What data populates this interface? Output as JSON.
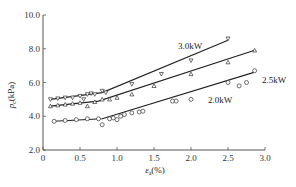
{
  "chart_data": {
    "type": "scatter",
    "title": "",
    "xlabel": "ε_a(%)",
    "ylabel": "p_c (kPa)",
    "xlim": [
      0,
      3.0
    ],
    "ylim": [
      2.0,
      10.0
    ],
    "x_ticks": [
      "0",
      "0.5",
      "1.0",
      "1.5",
      "2.0",
      "2.5",
      "3.0"
    ],
    "y_ticks": [
      "2.0",
      "4.0",
      "6.0",
      "8.0",
      "10.0"
    ],
    "grid": false,
    "legend": "inline labels",
    "series": [
      {
        "name": "3.0kW",
        "marker": "triangle-down",
        "fit_line": [
          [
            0.1,
            5.0
          ],
          [
            0.8,
            5.4
          ],
          [
            2.5,
            8.5
          ]
        ],
        "points": [
          [
            0.1,
            5.0
          ],
          [
            0.2,
            5.05
          ],
          [
            0.3,
            5.1
          ],
          [
            0.4,
            5.1
          ],
          [
            0.5,
            5.2
          ],
          [
            0.55,
            5.0
          ],
          [
            0.6,
            5.3
          ],
          [
            0.65,
            5.35
          ],
          [
            0.7,
            5.3
          ],
          [
            0.8,
            5.5
          ],
          [
            0.85,
            5.4
          ],
          [
            1.2,
            5.9
          ],
          [
            1.6,
            6.5
          ],
          [
            2.0,
            7.3
          ],
          [
            2.5,
            8.6
          ]
        ]
      },
      {
        "name": "2.5kW",
        "marker": "triangle-up",
        "fit_line": [
          [
            0.1,
            4.6
          ],
          [
            0.75,
            4.9
          ],
          [
            2.85,
            7.9
          ]
        ],
        "points": [
          [
            0.1,
            4.6
          ],
          [
            0.2,
            4.65
          ],
          [
            0.3,
            4.7
          ],
          [
            0.4,
            4.75
          ],
          [
            0.5,
            4.8
          ],
          [
            0.6,
            4.6
          ],
          [
            0.7,
            4.85
          ],
          [
            0.8,
            5.0
          ],
          [
            0.9,
            5.0
          ],
          [
            1.0,
            5.1
          ],
          [
            1.2,
            5.3
          ],
          [
            1.5,
            5.8
          ],
          [
            2.0,
            6.5
          ],
          [
            2.5,
            7.2
          ],
          [
            2.86,
            7.9
          ]
        ]
      },
      {
        "name": "2.0kW",
        "marker": "circle",
        "fit_line": [
          [
            0.15,
            3.7
          ],
          [
            0.8,
            3.85
          ],
          [
            2.85,
            6.6
          ]
        ],
        "points": [
          [
            0.15,
            3.7
          ],
          [
            0.3,
            3.75
          ],
          [
            0.45,
            3.8
          ],
          [
            0.6,
            3.85
          ],
          [
            0.75,
            3.85
          ],
          [
            0.8,
            3.5
          ],
          [
            0.9,
            3.85
          ],
          [
            0.95,
            3.9
          ],
          [
            1.0,
            3.8
          ],
          [
            1.05,
            4.0
          ],
          [
            1.1,
            4.1
          ],
          [
            1.2,
            4.2
          ],
          [
            1.3,
            4.25
          ],
          [
            1.35,
            4.3
          ],
          [
            1.75,
            4.9
          ],
          [
            1.8,
            4.9
          ],
          [
            2.0,
            5.0
          ],
          [
            2.5,
            6.0
          ],
          [
            2.65,
            5.8
          ],
          [
            2.75,
            6.0
          ],
          [
            2.86,
            6.7
          ]
        ]
      }
    ]
  },
  "labels": {
    "ylabel_p": "p",
    "ylabel_sub": "c",
    "ylabel_unit": "(kPa)",
    "xlabel_eps": "ε",
    "xlabel_sub": "a",
    "xlabel_unit": "(%)",
    "series_3": "3.0kW",
    "series_25": "2.5kW",
    "series_2": "2.0kW"
  }
}
